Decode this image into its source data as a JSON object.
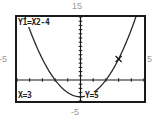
{
  "chart_data": {
    "type": "line",
    "title": "",
    "function": "Y1=X2-4",
    "expression": "x^2-4",
    "window": {
      "xmin": -5,
      "xmax": 5,
      "ymin": -5,
      "ymax": 15,
      "xscl": 1,
      "yscl": 1
    },
    "xlabel": "",
    "ylabel": "",
    "tick_labels": {
      "top": "15",
      "bottom": "-5",
      "left": "-5",
      "right": "5"
    },
    "trace": {
      "x": 3,
      "y": 5
    },
    "grid": false,
    "series": [
      {
        "name": "Y1",
        "x": [
          -4,
          -3,
          -2,
          -1,
          0,
          1,
          2,
          3,
          4
        ],
        "values": [
          12,
          5,
          0,
          -3,
          -4,
          -3,
          0,
          5,
          12
        ]
      }
    ]
  },
  "screen": {
    "function_label": "Y1=X2-4",
    "x_readout": "X=3",
    "y_readout": "Y=5"
  },
  "window_labels": {
    "top": "15",
    "bottom": "-5",
    "left": "-5",
    "right": "5"
  },
  "colors": {
    "curve": "#2a2a2a",
    "axes": "#1a1a1a",
    "border": "#1a1a1a",
    "label": "#9a9a9a"
  }
}
